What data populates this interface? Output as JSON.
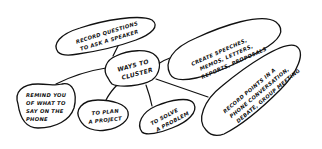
{
  "diagram": {
    "type": "cluster-mind-map",
    "style": "hand-drawn",
    "center": {
      "id": "center",
      "lines": [
        "WAYS TO",
        "CLUSTER"
      ]
    },
    "nodes": [
      {
        "id": "record-questions",
        "lines": [
          "RECORD QUESTIONS",
          "TO ASK A SPEAKER"
        ]
      },
      {
        "id": "create-speeches",
        "lines": [
          "CREATE SPEECHES,",
          "MEMOS, LETTERS,",
          "REPORTS, PROPOSALS"
        ]
      },
      {
        "id": "record-points",
        "lines": [
          "RECORD POINTS IN A",
          "PHONE CONVERSATION,",
          "DEBATE, GROUP MEETING"
        ]
      },
      {
        "id": "solve-problem",
        "lines": [
          "TO SOLVE",
          "A PROBLEM"
        ]
      },
      {
        "id": "plan-project",
        "lines": [
          "TO PLAN",
          "A PROJECT"
        ]
      },
      {
        "id": "remind-phone",
        "lines": [
          "REMIND YOU",
          "OF WHAT TO",
          "SAY ON THE",
          "PHONE"
        ]
      }
    ],
    "edges": [
      {
        "from": "center",
        "to": "record-questions"
      },
      {
        "from": "center",
        "to": "create-speeches"
      },
      {
        "from": "center",
        "to": "record-points"
      },
      {
        "from": "center",
        "to": "solve-problem"
      },
      {
        "from": "center",
        "to": "plan-project"
      },
      {
        "from": "center",
        "to": "remind-phone"
      }
    ],
    "colors": {
      "ink": "#111111",
      "paper": "#ffffff"
    }
  }
}
